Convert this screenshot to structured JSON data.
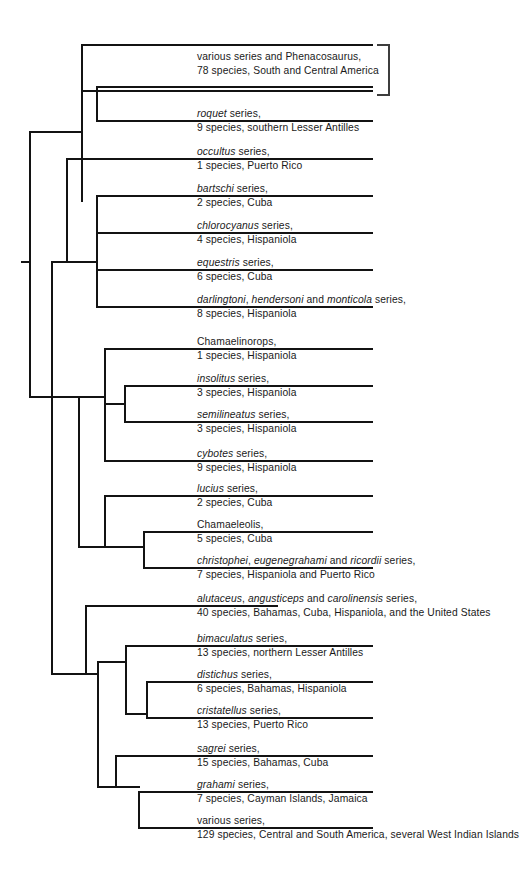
{
  "figure": {
    "type": "cladogram",
    "name": "anolis-phylogeny",
    "line_color": "#131313",
    "text_color": "#1a1a1a",
    "background": "#ffffff"
  },
  "taxa": [
    {
      "id": "various-phenacosaurus",
      "name_parts": [
        {
          "text": "various series and Phenacosaurus,",
          "italic": false
        }
      ],
      "name_plain": "various series and Phenacosaurus,",
      "info": "78 species, South and Central America",
      "bracketed": true
    },
    {
      "id": "roquet",
      "name_parts": [
        {
          "text": "roquet",
          "italic": true
        },
        {
          "text": " series,",
          "italic": false
        }
      ],
      "name_plain": "roquet series,",
      "info": "9 species, southern Lesser Antilles",
      "bracketed": true
    },
    {
      "id": "occultus",
      "name_parts": [
        {
          "text": "occultus",
          "italic": true
        },
        {
          "text": " series,",
          "italic": false
        }
      ],
      "name_plain": "occultus series,",
      "info": "1 species, Puerto Rico",
      "bracketed": false
    },
    {
      "id": "bartschi",
      "name_parts": [
        {
          "text": "bartschi",
          "italic": true
        },
        {
          "text": " series,",
          "italic": false
        }
      ],
      "name_plain": "bartschi series,",
      "info": "2 species, Cuba",
      "bracketed": false
    },
    {
      "id": "chlorocyanus",
      "name_parts": [
        {
          "text": "chlorocyanus",
          "italic": true
        },
        {
          "text": " series,",
          "italic": false
        }
      ],
      "name_plain": "chlorocyanus series,",
      "info": "4 species, Hispaniola",
      "bracketed": false
    },
    {
      "id": "equestris",
      "name_parts": [
        {
          "text": "equestris",
          "italic": true
        },
        {
          "text": " series,",
          "italic": false
        }
      ],
      "name_plain": "equestris series,",
      "info": "6 species, Cuba",
      "bracketed": false
    },
    {
      "id": "darlingtoni-hendersoni-monticola",
      "name_parts": [
        {
          "text": "darlingtoni",
          "italic": true
        },
        {
          "text": ", ",
          "italic": false
        },
        {
          "text": "hendersoni",
          "italic": true
        },
        {
          "text": " and ",
          "italic": false
        },
        {
          "text": "monticola",
          "italic": true
        },
        {
          "text": " series,",
          "italic": false
        }
      ],
      "name_plain": "darlingtoni, hendersoni and monticola series,",
      "info": "8 species, Hispaniola",
      "bracketed": false
    },
    {
      "id": "chamaelinorops",
      "name_parts": [
        {
          "text": "Chamaelinorops,",
          "italic": false
        }
      ],
      "name_plain": "Chamaelinorops,",
      "info": "1 species, Hispaniola",
      "bracketed": false
    },
    {
      "id": "insolitus",
      "name_parts": [
        {
          "text": "insolitus",
          "italic": true
        },
        {
          "text": " series,",
          "italic": false
        }
      ],
      "name_plain": "insolitus series,",
      "info": "3 species, Hispaniola",
      "bracketed": false
    },
    {
      "id": "semilineatus",
      "name_parts": [
        {
          "text": "semilineatus",
          "italic": true
        },
        {
          "text": " series,",
          "italic": false
        }
      ],
      "name_plain": "semilineatus series,",
      "info": "3 species, Hispaniola",
      "bracketed": false
    },
    {
      "id": "cybotes",
      "name_parts": [
        {
          "text": "cybotes",
          "italic": true
        },
        {
          "text": " series,",
          "italic": false
        }
      ],
      "name_plain": "cybotes series,",
      "info": "9 species, Hispaniola",
      "bracketed": false
    },
    {
      "id": "lucius",
      "name_parts": [
        {
          "text": "lucius",
          "italic": true
        },
        {
          "text": " series,",
          "italic": false
        }
      ],
      "name_plain": "lucius series,",
      "info": "2 species, Cuba",
      "bracketed": false
    },
    {
      "id": "chamaeleolis",
      "name_parts": [
        {
          "text": "Chamaeleolis,",
          "italic": false
        }
      ],
      "name_plain": "Chamaeleolis,",
      "info": "5 species, Cuba",
      "bracketed": false
    },
    {
      "id": "christophei-eugenegrahami-ricordii",
      "name_parts": [
        {
          "text": "christophei",
          "italic": true
        },
        {
          "text": ", ",
          "italic": false
        },
        {
          "text": "eugenegrahami",
          "italic": true
        },
        {
          "text": " and ",
          "italic": false
        },
        {
          "text": "ricordii",
          "italic": true
        },
        {
          "text": " series,",
          "italic": false
        }
      ],
      "name_plain": "christophei, eugenegrahami and ricordii series,",
      "info": "7 species, Hispaniola and Puerto Rico",
      "bracketed": false
    },
    {
      "id": "alutaceus-angusticeps-carolinensis",
      "name_parts": [
        {
          "text": "alutaceus",
          "italic": true
        },
        {
          "text": ", ",
          "italic": false
        },
        {
          "text": "angusticeps",
          "italic": true
        },
        {
          "text": " and ",
          "italic": false
        },
        {
          "text": "carolinensis",
          "italic": true
        },
        {
          "text": " series,",
          "italic": false
        }
      ],
      "name_plain": "alutaceus, angusticeps and carolinensis series,",
      "info": "40 species, Bahamas, Cuba, Hispaniola, and the United States",
      "bracketed": false
    },
    {
      "id": "bimaculatus",
      "name_parts": [
        {
          "text": "bimaculatus",
          "italic": true
        },
        {
          "text": " series,",
          "italic": false
        }
      ],
      "name_plain": "bimaculatus series,",
      "info": "13 species, northern Lesser Antilles",
      "bracketed": false
    },
    {
      "id": "distichus",
      "name_parts": [
        {
          "text": "distichus",
          "italic": true
        },
        {
          "text": " series,",
          "italic": false
        }
      ],
      "name_plain": "distichus series,",
      "info": "6 species, Bahamas, Hispaniola",
      "bracketed": false
    },
    {
      "id": "cristatellus",
      "name_parts": [
        {
          "text": "cristatellus",
          "italic": true
        },
        {
          "text": " series,",
          "italic": false
        }
      ],
      "name_plain": "cristatellus series,",
      "info": "13 species, Puerto Rico",
      "bracketed": false
    },
    {
      "id": "sagrei",
      "name_parts": [
        {
          "text": "sagrei",
          "italic": true
        },
        {
          "text": " series,",
          "italic": false
        }
      ],
      "name_plain": "sagrei series,",
      "info": "15 species, Bahamas, Cuba",
      "bracketed": false
    },
    {
      "id": "grahami",
      "name_parts": [
        {
          "text": "grahami",
          "italic": true
        },
        {
          "text": " series,",
          "italic": false
        }
      ],
      "name_plain": "grahami series,",
      "info": "7 species, Cayman Islands, Jamaica",
      "bracketed": false
    },
    {
      "id": "various-lower",
      "name_parts": [
        {
          "text": "various series,",
          "italic": false
        }
      ],
      "name_plain": "various series,",
      "info": "129 species, Central and South America, several West Indian Islands",
      "bracketed": false
    }
  ]
}
